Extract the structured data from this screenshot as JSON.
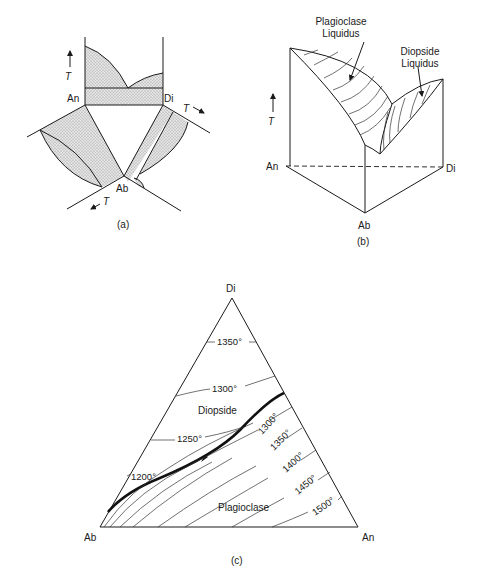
{
  "panel_a": {
    "caption": "(a)",
    "vertices": {
      "an": "An",
      "di": "Di",
      "ab": "Ab"
    },
    "temp_axis": "T"
  },
  "panel_b": {
    "caption": "(b)",
    "vertices": {
      "an": "An",
      "di": "Di",
      "ab": "Ab"
    },
    "temp_axis": "T",
    "plagioclase_label_1": "Plagioclase",
    "plagioclase_label_2": "Liquidus",
    "diopside_label_1": "Diopside",
    "diopside_label_2": "Liquidus"
  },
  "panel_c": {
    "caption": "(c)",
    "vertices": {
      "di": "Di",
      "ab": "Ab",
      "an": "An"
    },
    "fields": {
      "diopside": "Diopside",
      "plagioclase": "Plagioclase"
    },
    "diopside_isotherms": [
      "1350°",
      "1300°",
      "1250°",
      "1200°"
    ],
    "plagioclase_isotherms": [
      "1300°",
      "1350°",
      "1400°",
      "1450°",
      "1500°"
    ]
  },
  "colors": {
    "line": "#1a1a1a",
    "stipple": "#d9d9d9",
    "background": "#ffffff"
  }
}
